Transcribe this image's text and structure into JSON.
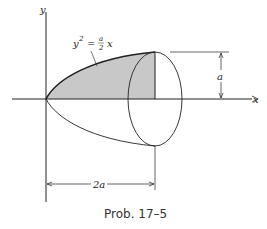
{
  "diagram": {
    "axis_labels": {
      "y": "y",
      "x": "x"
    },
    "equation": {
      "lhs": "y",
      "exp": "2",
      "eq": "=",
      "num": "a",
      "den": "2",
      "var": "x"
    },
    "dimensions": {
      "height": "a",
      "length": "2a"
    },
    "caption": "Prob. 17–5",
    "colors": {
      "shade": "#c8c8c8",
      "line": "#222222"
    }
  }
}
